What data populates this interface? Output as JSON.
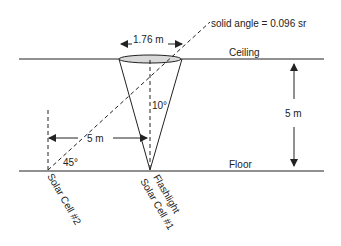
{
  "labels": {
    "solid_angle": "solid angle = 0.096 sr",
    "diameter": "1.76 m",
    "ceiling": "Ceiling",
    "floor": "Floor",
    "height": "5 m",
    "distance": "5 m",
    "cone_angle": "10°",
    "incidence_angle": "45°",
    "flashlight": "Flashlight",
    "solar_cell_1": "Solar Cell #1",
    "solar_cell_2": "Solar Cell #2"
  },
  "colors": {
    "line": "#222222",
    "ellipse_fill": "#d9d9d9"
  }
}
